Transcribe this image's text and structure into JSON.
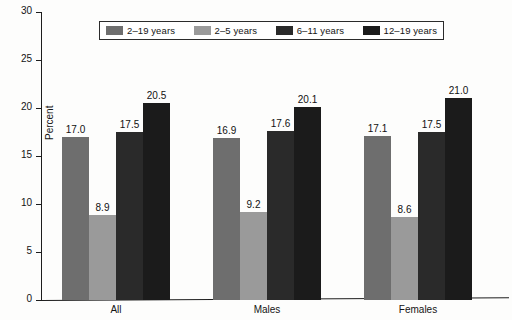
{
  "chart_data": {
    "type": "bar",
    "title": "",
    "subtitle": "",
    "xlabel": "",
    "ylabel": "Percent",
    "ylim": [
      0,
      30
    ],
    "yticks": [
      0,
      5,
      10,
      15,
      20,
      25,
      30
    ],
    "ytick_labels": [
      "0",
      "5",
      "10",
      "15",
      "20",
      "25",
      "30"
    ],
    "grid": false,
    "legend_position": "top-center",
    "categories": [
      "All",
      "Males",
      "Females"
    ],
    "series": [
      {
        "name": "2–19 years",
        "color": "#6e6e6e",
        "values": [
          17.0,
          16.9,
          17.1
        ],
        "value_labels": [
          "17.0",
          "16.9",
          "17.1"
        ]
      },
      {
        "name": "2–5 years",
        "color": "#9a9a9a",
        "values": [
          8.9,
          9.2,
          8.6
        ],
        "value_labels": [
          "8.9",
          "9.2",
          "8.6"
        ]
      },
      {
        "name": "6–11 years",
        "color": "#2a2a2a",
        "values": [
          17.5,
          17.6,
          17.5
        ],
        "value_labels": [
          "17.5",
          "17.6",
          "17.5"
        ]
      },
      {
        "name": "12–19 years",
        "color": "#1b1b1b",
        "values": [
          20.5,
          20.1,
          21.0
        ],
        "value_labels": [
          "20.5",
          "20.1",
          "21.0"
        ]
      }
    ]
  },
  "legend": {
    "entries": [
      {
        "label": "2–19 years",
        "swatch_color": "#6e6e6e",
        "icon": "legend-swatch-icon"
      },
      {
        "label": "2–5 years",
        "swatch_color": "#9a9a9a",
        "icon": "legend-swatch-icon"
      },
      {
        "label": "6–11 years",
        "swatch_color": "#2a2a2a",
        "icon": "legend-swatch-icon"
      },
      {
        "label": "12–19 years",
        "swatch_color": "#1b1b1b",
        "icon": "legend-swatch-icon"
      }
    ]
  },
  "axes": {
    "y_title": "Percent",
    "y_tick_labels": [
      "30",
      "25",
      "20",
      "15",
      "10",
      "5",
      "0"
    ],
    "x_group_labels": [
      "All",
      "Males",
      "Females"
    ]
  },
  "colors": {
    "axis": "#1d1d1d",
    "text": "#141414",
    "background": "#fdfdfc",
    "series_1": "#6e6e6e",
    "series_2": "#9a9a9a",
    "series_3": "#2a2a2a",
    "series_4": "#1b1b1b"
  }
}
